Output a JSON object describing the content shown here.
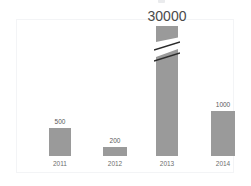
{
  "chart_data": {
    "type": "bar",
    "title": "",
    "subtitle": "",
    "xlabel": "",
    "ylabel": "",
    "categories": [
      "2011",
      "2012",
      "2013",
      "2014"
    ],
    "values": [
      500,
      200,
      30000,
      1000
    ],
    "data_labels": [
      "500",
      "200",
      "30000",
      "1000"
    ],
    "series": [
      {
        "name": "",
        "values": [
          500,
          200,
          30000,
          1000
        ]
      }
    ],
    "grid": false,
    "legend": false,
    "legend_position": "none",
    "axis_line": false,
    "tick_labels_y": [],
    "ylim": [
      0,
      30000
    ],
    "annotations": [
      {
        "category": "2013",
        "kind": "axis-break",
        "note": "diagonal break slash across bar indicating truncated/off-scale value"
      }
    ],
    "bar_color": "#9a9a9a",
    "frame_color": "#f3f4f6",
    "label_color": "#595959",
    "category_label_color": "#6d6d6d",
    "background_color": "#ffffff",
    "emphasis_label": "30000"
  },
  "bars": [
    {
      "category": "2011",
      "label": "500",
      "left": 32,
      "width": 22,
      "bar_height": 28,
      "label_size": "small",
      "broken": false
    },
    {
      "category": "2012",
      "label": "200",
      "left": 86,
      "width": 24,
      "bar_height": 9,
      "label_size": "small",
      "broken": false
    },
    {
      "category": "2013",
      "label": "30000",
      "left": 139,
      "width": 22,
      "bar_height": 107,
      "label_size": "big",
      "broken": true,
      "stub_height": 16,
      "break_gap": 7
    },
    {
      "category": "2014",
      "label": "1000",
      "left": 194,
      "width": 24,
      "bar_height": 45,
      "label_size": "small",
      "broken": false
    }
  ]
}
